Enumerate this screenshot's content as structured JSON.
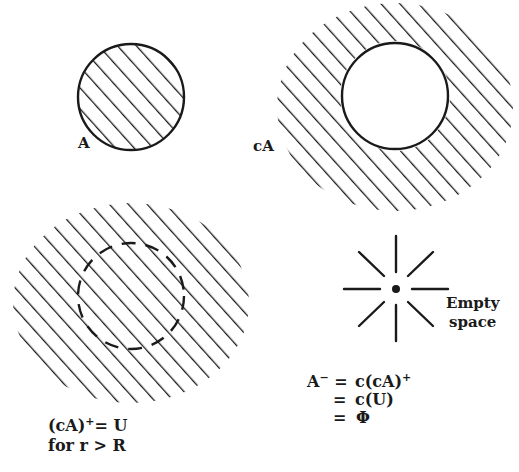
{
  "colors": {
    "ink": "#1a1a1a",
    "background": "#ffffff"
  },
  "panels": {
    "set_a": {
      "label": "A",
      "circle": {
        "cx": 131,
        "cy": 97,
        "r": 53,
        "hatched_inside": true
      }
    },
    "complement_a": {
      "label": "cA",
      "circle": {
        "cx": 395,
        "cy": 96,
        "r": 53,
        "hatched_inside": false
      },
      "hatched_region": "outside circle"
    },
    "closure_complement": {
      "dashed_circle": {
        "cx": 131,
        "cy": 296,
        "r": 53
      },
      "hatched_region": "entire disk including dashed circle",
      "equation_line1_base": "(cA)",
      "equation_line1_sup": "+",
      "equation_line1_rest": "= U",
      "equation_line2": "for r > R"
    },
    "empty_space": {
      "label_line1": "Empty",
      "label_line2": "space",
      "center": {
        "x": 396,
        "y": 289
      },
      "icon": "starburst-point-icon"
    },
    "interior_equations": {
      "line1_lhs_base": "A",
      "line1_lhs_sup": "−",
      "line1_eq": "=",
      "line1_rhs_base": "c(cA)",
      "line1_rhs_sup": "+",
      "line2_eq": "=",
      "line2_rhs": "c(U)",
      "line3_eq": "=",
      "line3_rhs": "Φ"
    }
  }
}
